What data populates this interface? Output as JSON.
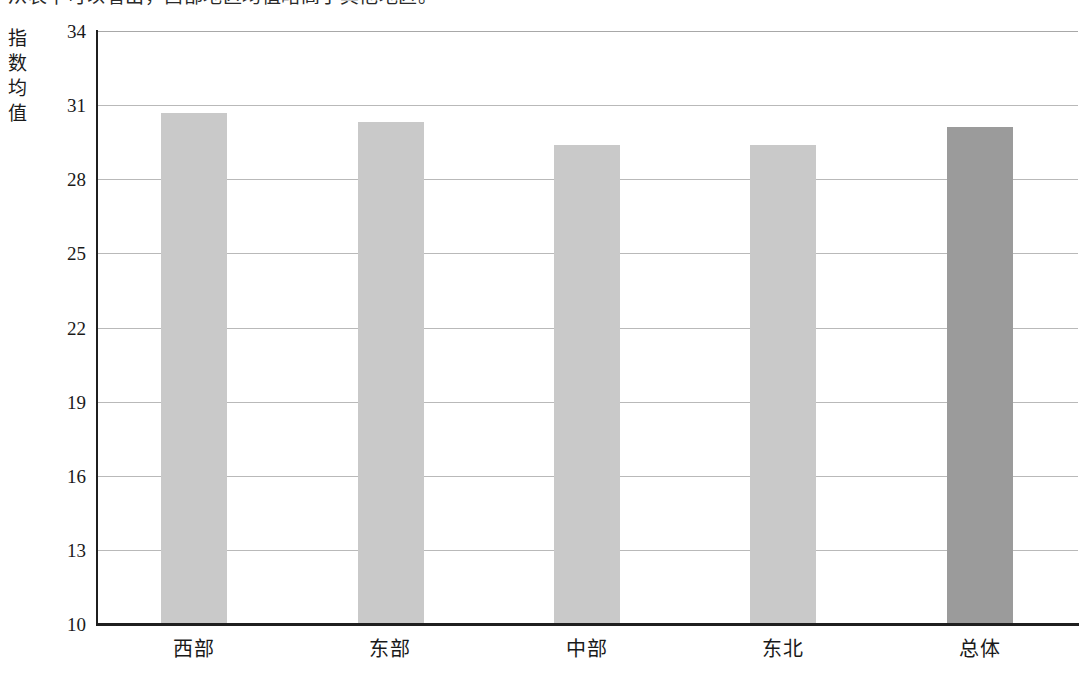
{
  "page": {
    "top_cropped_line": "从表中可以看出，西部地区均值略高于其他地区。",
    "background_color": "#ffffff"
  },
  "chart_data": {
    "type": "bar",
    "title": "",
    "xlabel": "",
    "ylabel": "指数均值",
    "ylabel_chars": [
      "指",
      "数",
      "均",
      "值"
    ],
    "categories": [
      "西部",
      "东部",
      "中部",
      "东北",
      "总体"
    ],
    "values": [
      30.7,
      30.3,
      29.4,
      29.4,
      30.1
    ],
    "ylim": [
      10,
      34
    ],
    "ytick_labels": [
      "34",
      "31",
      "28",
      "25",
      "22",
      "19",
      "16",
      "13",
      "10"
    ],
    "ytick_values": [
      34,
      31,
      28,
      25,
      22,
      19,
      16,
      13,
      10
    ],
    "grid": true,
    "legend": "none",
    "bar_colors": [
      "#c9c9c9",
      "#c9c9c9",
      "#c9c9c9",
      "#c9c9c9",
      "#9b9b9b"
    ],
    "highlight_category": "总体",
    "axis_color": "#1f1f1f",
    "gridline_color": "#b9b9b9"
  }
}
